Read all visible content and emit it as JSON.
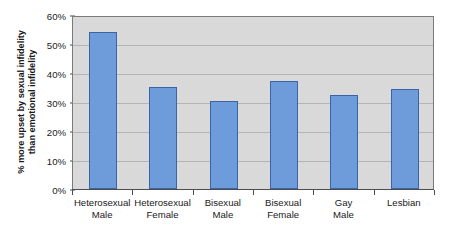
{
  "chart_data": {
    "type": "bar",
    "title": "",
    "xlabel": "",
    "ylabel": "% more upset by sexual infidelity than emotional infidelity",
    "ylabel_line1": "% more upset by sexual infidelity",
    "ylabel_line2": "than emotional infidelity",
    "categories": [
      "Heterosexual Male",
      "Heterosexual Female",
      "Bisexual Male",
      "Bisexual Female",
      "Gay Male",
      "Lesbian"
    ],
    "category_lines": [
      [
        "Heterosexual",
        "Male"
      ],
      [
        "Heterosexual",
        "Female"
      ],
      [
        "Bisexual",
        "Male"
      ],
      [
        "Bisexual",
        "Female"
      ],
      [
        "Gay",
        "Male"
      ],
      [
        "Lesbian",
        ""
      ]
    ],
    "values": [
      54.2,
      35.2,
      30.2,
      37.4,
      32.4,
      34.4
    ],
    "ylim": [
      0,
      60
    ],
    "ytick_values": [
      0,
      10,
      20,
      30,
      40,
      50,
      60
    ],
    "ytick_labels": [
      "0%",
      "10%",
      "20%",
      "30%",
      "40%",
      "50%",
      "60%"
    ],
    "grid": true,
    "legend": false,
    "legend_position": "none",
    "colors": {
      "bar_fill": "#6E9BD9",
      "bar_border": "#3A63A8",
      "plot_background": "#D9D9D9",
      "plot_border": "#7A7A7A",
      "gridline": "#B4B4B4",
      "axis_line": "#4D4D4D",
      "text": "#1A1A1A",
      "page_background": "#FFFFFF"
    }
  }
}
